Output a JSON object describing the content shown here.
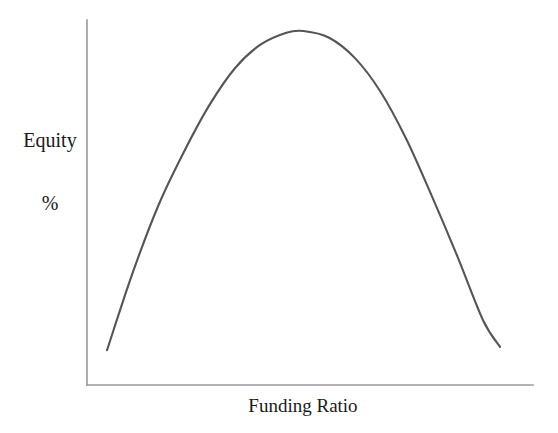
{
  "figure": {
    "background_color": "#ffffff",
    "axis_color": "#9a9a9a",
    "curve_color": "#555555"
  },
  "labels": {
    "y_axis_line1": "Equity",
    "y_axis_line2": "%",
    "x_axis": "Funding Ratio"
  },
  "chart_data": {
    "type": "line",
    "title": "",
    "subtitle": "",
    "xlabel": "Funding Ratio",
    "ylabel": "Equity %",
    "grid": false,
    "legend": null,
    "legend_position": "none",
    "xlim": [
      0,
      100
    ],
    "ylim": [
      0,
      100
    ],
    "x_tick_labels": [],
    "y_tick_labels": [],
    "annotations": [],
    "series": [
      {
        "name": "Equity vs Funding Ratio",
        "x": [
          4,
          10,
          16,
          22,
          28,
          34,
          40,
          46,
          50,
          56,
          62,
          68,
          74,
          80,
          86,
          92,
          96
        ],
        "y": [
          5,
          28,
          48,
          64,
          78,
          89,
          96,
          99.5,
          100,
          98,
          92,
          82,
          68,
          51,
          33,
          14,
          6
        ]
      }
    ]
  }
}
